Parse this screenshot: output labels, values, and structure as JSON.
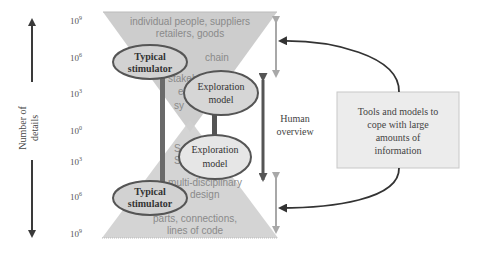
{
  "axis": {
    "label_line1": "Number of",
    "label_line2": "details",
    "ticks": [
      {
        "base": "10",
        "exp": "9",
        "y": 20
      },
      {
        "base": "10",
        "exp": "6",
        "y": 57
      },
      {
        "base": "10",
        "exp": "3",
        "y": 93
      },
      {
        "base": "10",
        "exp": "0",
        "y": 130
      },
      {
        "base": "10",
        "exp": "3",
        "y": 161
      },
      {
        "base": "10",
        "exp": "6",
        "y": 196
      },
      {
        "base": "10",
        "exp": "9",
        "y": 233
      }
    ]
  },
  "funnel": {
    "top_line1": "individual people, suppliers",
    "top_line2": "retailers, goods",
    "top_mid1": "chain",
    "top_mid2": "stakeh",
    "top_mid3": "e",
    "top_mid4": "sy",
    "bottom_mid1": "S",
    "bottom_mid2": "S",
    "bottom_line0": "multi-disciplinary",
    "bottom_line0b": "design",
    "bottom_line1": "parts, connections,",
    "bottom_line2": "lines of code"
  },
  "ellipses": {
    "typical_top": [
      "Typical",
      "stimulator"
    ],
    "exploration_top": [
      "Exploration",
      "model"
    ],
    "exploration_bottom": [
      "Exploration",
      "model"
    ],
    "typical_bottom": [
      "Typical",
      "stimulator"
    ]
  },
  "human_overview": [
    "Human",
    "overview"
  ],
  "tools_box": [
    "Tools and models to",
    "cope with large",
    "amounts of",
    "information"
  ],
  "colors": {
    "funnel_fill": "#c8c8c8",
    "ellipse_fill": "#d4d4d4",
    "ellipse_stroke": "#555555",
    "bar": "#6a6a6a",
    "light_arrow": "#a8a8a8",
    "dark_arrow": "#555555",
    "box_fill": "#ececec"
  }
}
